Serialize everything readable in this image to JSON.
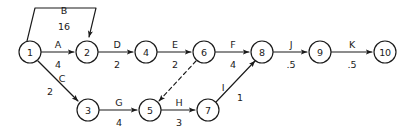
{
  "diagram": {
    "type": "activity-on-arrow-network",
    "background_color": "#ffffff",
    "line_color": "#1a1a1a",
    "nodes": [
      {
        "id": "1",
        "label": "1",
        "x": 30,
        "y": 52,
        "r": 11
      },
      {
        "id": "2",
        "label": "2",
        "x": 87,
        "y": 52,
        "r": 11
      },
      {
        "id": "3",
        "label": "3",
        "x": 88,
        "y": 110,
        "r": 11
      },
      {
        "id": "4",
        "label": "4",
        "x": 146,
        "y": 52,
        "r": 11
      },
      {
        "id": "5",
        "label": "5",
        "x": 150,
        "y": 110,
        "r": 11
      },
      {
        "id": "6",
        "label": "6",
        "x": 204,
        "y": 52,
        "r": 11
      },
      {
        "id": "7",
        "label": "7",
        "x": 208,
        "y": 110,
        "r": 11
      },
      {
        "id": "8",
        "label": "8",
        "x": 262,
        "y": 52,
        "r": 11
      },
      {
        "id": "9",
        "label": "9",
        "x": 320,
        "y": 52,
        "r": 11
      },
      {
        "id": "10",
        "label": "10",
        "x": 385,
        "y": 52,
        "r": 11
      }
    ],
    "activities": [
      {
        "id": "A",
        "name": "A",
        "duration": "4",
        "from": "1",
        "to": "2",
        "style": "solid",
        "name_x": 58,
        "name_y": 48,
        "dur_x": 58,
        "dur_y": 64
      },
      {
        "id": "B",
        "name": "B",
        "duration": "16",
        "from": "1",
        "to": "2",
        "style": "solid",
        "name_x": 64,
        "name_y": 12,
        "dur_x": 64,
        "dur_y": 26
      },
      {
        "id": "C",
        "name": "C",
        "duration": "2",
        "from": "1",
        "to": "3",
        "style": "solid",
        "name_x": 60,
        "name_y": 80,
        "dur_x": 48,
        "dur_y": 92
      },
      {
        "id": "D",
        "name": "D",
        "duration": "2",
        "from": "2",
        "to": "4",
        "style": "solid",
        "name_x": 117,
        "name_y": 48,
        "dur_x": 117,
        "dur_y": 64
      },
      {
        "id": "E",
        "name": "E",
        "duration": "2",
        "from": "4",
        "to": "6",
        "style": "solid",
        "name_x": 175,
        "name_y": 48,
        "dur_x": 175,
        "dur_y": 64
      },
      {
        "id": "F",
        "name": "F",
        "duration": "4",
        "from": "6",
        "to": "8",
        "style": "solid",
        "name_x": 233,
        "name_y": 48,
        "dur_x": 233,
        "dur_y": 64
      },
      {
        "id": "G",
        "name": "G",
        "duration": "4",
        "from": "3",
        "to": "5",
        "style": "solid",
        "name_x": 119,
        "name_y": 106,
        "dur_x": 119,
        "dur_y": 122
      },
      {
        "id": "H",
        "name": "H",
        "duration": "3",
        "from": "5",
        "to": "7",
        "style": "solid",
        "name_x": 179,
        "name_y": 106,
        "dur_x": 179,
        "dur_y": 122
      },
      {
        "id": "I",
        "name": "I",
        "duration": "1",
        "from": "7",
        "to": "8",
        "style": "solid",
        "name_x": 224,
        "name_y": 88,
        "dur_x": 240,
        "dur_y": 98
      },
      {
        "id": "J",
        "name": "J",
        "duration": ".5",
        "from": "8",
        "to": "9",
        "style": "solid",
        "name_x": 291,
        "name_y": 48,
        "dur_x": 291,
        "dur_y": 64
      },
      {
        "id": "K",
        "name": "K",
        "duration": ".5",
        "from": "9",
        "to": "10",
        "style": "solid",
        "name_x": 352,
        "name_y": 48,
        "dur_x": 352,
        "dur_y": 64
      },
      {
        "id": "dummy",
        "name": "",
        "duration": "",
        "from": "6",
        "to": "5",
        "style": "dashed",
        "name_x": 0,
        "name_y": 0,
        "dur_x": 0,
        "dur_y": 0
      }
    ]
  }
}
